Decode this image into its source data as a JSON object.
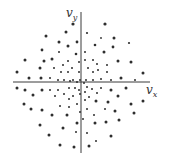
{
  "figure": {
    "type": "scatter",
    "x_label": {
      "main": "v",
      "sub": "x"
    },
    "y_label": {
      "main": "v",
      "sub": "y"
    },
    "axis_color": "#3a3a3a",
    "dot_color": "#2e2e2e"
  },
  "chart_data": {
    "type": "scatter",
    "title": "",
    "xlabel": "v_x",
    "ylabel": "v_y",
    "grid": false,
    "legend": null,
    "origin_px": [
      81,
      82
    ],
    "points_px": [
      [
        73,
        24,
        1.6
      ],
      [
        105,
        24,
        1.6
      ],
      [
        66,
        32,
        1.5
      ],
      [
        87,
        33,
        1.1
      ],
      [
        46,
        36,
        1.5
      ],
      [
        114,
        38,
        1.5
      ],
      [
        101,
        38,
        0.9
      ],
      [
        59,
        42,
        1.5
      ],
      [
        77,
        42,
        1.4
      ],
      [
        129,
        43,
        1.1
      ],
      [
        95,
        45,
        1.3
      ],
      [
        68,
        46,
        1.5
      ],
      [
        113,
        47,
        1.4
      ],
      [
        42,
        50,
        1.4
      ],
      [
        59,
        52,
        1.0
      ],
      [
        85,
        52,
        1.0
      ],
      [
        104,
        52,
        1.5
      ],
      [
        76,
        54,
        1.3
      ],
      [
        25,
        60,
        1.5
      ],
      [
        44,
        61,
        1.5
      ],
      [
        52,
        59,
        1.5
      ],
      [
        85,
        60,
        1.0
      ],
      [
        68,
        61,
        1.0
      ],
      [
        93,
        60,
        1.0
      ],
      [
        118,
        61,
        1.5
      ],
      [
        131,
        62,
        1.5
      ],
      [
        79,
        62,
        1.0
      ],
      [
        63,
        65,
        1.0
      ],
      [
        97,
        64,
        1.0
      ],
      [
        107,
        65,
        1.0
      ],
      [
        40,
        68,
        1.5
      ],
      [
        54,
        68,
        1.0
      ],
      [
        72,
        68,
        1.0
      ],
      [
        88,
        68,
        1.0
      ],
      [
        98,
        70,
        1.0
      ],
      [
        17,
        72,
        1.5
      ],
      [
        61,
        72,
        1.0
      ],
      [
        68,
        72,
        1.0
      ],
      [
        79,
        72,
        1.0
      ],
      [
        93,
        72,
        1.0
      ],
      [
        107,
        72,
        1.0
      ],
      [
        143,
        73,
        1.5
      ],
      [
        29,
        78,
        1.5
      ],
      [
        41,
        78,
        1.5
      ],
      [
        50,
        78,
        1.0
      ],
      [
        58,
        80,
        1.0
      ],
      [
        64,
        80,
        1.0
      ],
      [
        73,
        80,
        1.0
      ],
      [
        80,
        80,
        1.0
      ],
      [
        86,
        80,
        1.0
      ],
      [
        93,
        80,
        1.0
      ],
      [
        101,
        79,
        1.0
      ],
      [
        111,
        80,
        1.0
      ],
      [
        121,
        78,
        1.5
      ],
      [
        135,
        80,
        1.0
      ],
      [
        70,
        81,
        1.0
      ],
      [
        77,
        82,
        1.0
      ],
      [
        84,
        83,
        1.0
      ],
      [
        17,
        88,
        1.5
      ],
      [
        25,
        90,
        1.5
      ],
      [
        42,
        90,
        1.5
      ],
      [
        50,
        90,
        1.0
      ],
      [
        58,
        90,
        1.0
      ],
      [
        69,
        88,
        1.0
      ],
      [
        75,
        88,
        1.0
      ],
      [
        87,
        87,
        1.0
      ],
      [
        92,
        89,
        1.0
      ],
      [
        101,
        88,
        1.0
      ],
      [
        111,
        90,
        1.5
      ],
      [
        126,
        88,
        1.5
      ],
      [
        79,
        90,
        1.0
      ],
      [
        85,
        92,
        1.0
      ],
      [
        33,
        95,
        1.5
      ],
      [
        55,
        96,
        1.0
      ],
      [
        64,
        94,
        1.0
      ],
      [
        80,
        94,
        1.0
      ],
      [
        97,
        93,
        1.0
      ],
      [
        118,
        96,
        1.5
      ],
      [
        73,
        96,
        1.0
      ],
      [
        89,
        97,
        1.0
      ],
      [
        24,
        104,
        1.5
      ],
      [
        60,
        106,
        1.0
      ],
      [
        77,
        104,
        1.0
      ],
      [
        96,
        101,
        1.5
      ],
      [
        108,
        102,
        1.5
      ],
      [
        143,
        101,
        1.5
      ],
      [
        85,
        100,
        1.0
      ],
      [
        69,
        99,
        1.0
      ],
      [
        31,
        109,
        1.5
      ],
      [
        42,
        110,
        1.5
      ],
      [
        69,
        107,
        1.0
      ],
      [
        87,
        109,
        1.0
      ],
      [
        131,
        104,
        1.5
      ],
      [
        105,
        109,
        1.0
      ],
      [
        115,
        111,
        1.5
      ],
      [
        80,
        112,
        1.0
      ],
      [
        52,
        115,
        1.5
      ],
      [
        67,
        115,
        1.5
      ],
      [
        94,
        115,
        1.0
      ],
      [
        134,
        113,
        1.5
      ],
      [
        83,
        119,
        1.0
      ],
      [
        119,
        120,
        1.5
      ],
      [
        40,
        125,
        1.5
      ],
      [
        77,
        123,
        1.5
      ],
      [
        95,
        123,
        1.5
      ],
      [
        106,
        122,
        1.5
      ],
      [
        63,
        128,
        1.5
      ],
      [
        87,
        133,
        1.0
      ],
      [
        49,
        135,
        1.5
      ],
      [
        111,
        136,
        1.5
      ],
      [
        76,
        132,
        1.0
      ],
      [
        96,
        141,
        1.0
      ],
      [
        60,
        145,
        1.5
      ],
      [
        74,
        147,
        1.5
      ],
      [
        89,
        146,
        1.5
      ]
    ]
  }
}
